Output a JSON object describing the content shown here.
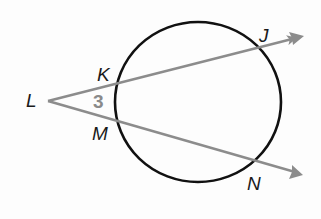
{
  "diagram": {
    "type": "circle-with-two-secants",
    "colors": {
      "circle": "#111111",
      "rays": "#8c8c8c",
      "labels": "#1a1a1a",
      "angle_label": "#8a8a8a",
      "background": "#fdfdfd"
    },
    "circle": {
      "cx": 198,
      "cy": 102,
      "rx": 83,
      "ry": 80
    },
    "vertex": {
      "name": "L",
      "x": 48,
      "y": 101
    },
    "rays": [
      {
        "name": "ray-LJ",
        "from": "L",
        "through": [
          "K",
          "J"
        ],
        "x1": 48,
        "y1": 101,
        "x2": 304,
        "y2": 36
      },
      {
        "name": "ray-LN",
        "from": "L",
        "through": [
          "M",
          "N"
        ],
        "x1": 48,
        "y1": 101,
        "x2": 303,
        "y2": 175
      }
    ],
    "labels": {
      "L": "L",
      "K": "K",
      "J": "J",
      "M": "M",
      "N": "N",
      "angle": "3"
    }
  }
}
